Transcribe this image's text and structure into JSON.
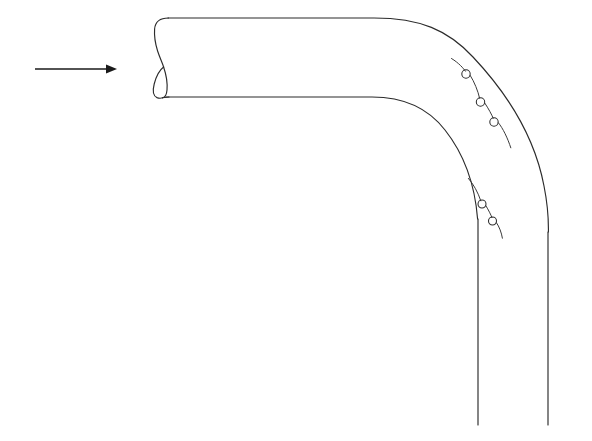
{
  "figure": {
    "canvas": {
      "width": 592,
      "height": 441,
      "background": "#ffffff"
    },
    "line_color": "#2b2b2b",
    "accent_color": "#1a1a1a",
    "caption": ""
  },
  "flow_arrow": {
    "label": "flow direction",
    "x_start": 35,
    "x_end": 117,
    "y": 69,
    "head_length": 11,
    "head_half_width": 4.5
  },
  "pipe": {
    "label": "curved pipe duct",
    "inlet_x": 155,
    "top_wall_y": 18,
    "bottom_wall_y": 97,
    "inner_wall_vertical_x": 478,
    "outer_wall_vertical_x": 548,
    "vertical_leg_end_y": 425,
    "bend_start_x": 375,
    "bend_outer_start_x": 430
  },
  "inlet_opening": {
    "label": "elliptical inlet opening",
    "left_x": 152,
    "right_x": 168,
    "top_y": 62,
    "bottom_y": 98
  },
  "streaklines": [
    {
      "name": "outer-wall-streakline",
      "origin": {
        "x": 451,
        "y": 58
      },
      "end": {
        "x": 511,
        "y": 148
      },
      "markers": [
        {
          "x": 466,
          "y": 74,
          "r": 4.2
        },
        {
          "x": 480.5,
          "y": 102,
          "r": 4.2
        },
        {
          "x": 494,
          "y": 122,
          "r": 4.2
        }
      ]
    },
    {
      "name": "inner-wall-streakline",
      "origin": {
        "x": 468,
        "y": 178
      },
      "end": {
        "x": 502,
        "y": 238
      },
      "markers": [
        {
          "x": 482,
          "y": 204,
          "r": 4.0
        },
        {
          "x": 492.5,
          "y": 221,
          "r": 4.0
        }
      ]
    }
  ]
}
